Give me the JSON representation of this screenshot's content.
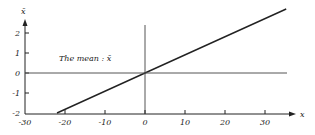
{
  "chart_data": {
    "type": "line",
    "title": "",
    "xlabel": "x",
    "ylabel": "x̄",
    "xlim": [
      -30,
      35
    ],
    "ylim": [
      -2,
      2.5
    ],
    "x_ticks": [
      -30,
      -20,
      -10,
      0,
      10,
      20,
      30
    ],
    "x_tick_labels": [
      "-30",
      "-20",
      "-10",
      "0",
      "10",
      "20",
      "30"
    ],
    "y_ticks": [
      -2,
      -1,
      0,
      1,
      2
    ],
    "y_tick_labels": [
      "-2",
      "-1",
      "0",
      "1",
      "2"
    ],
    "grid": false,
    "annotation": "The mean : x̄",
    "series": [
      {
        "name": "x̄ vs x",
        "x": [
          -22,
          0,
          35.3
        ],
        "y": [
          -2,
          0,
          3.2
        ],
        "color": "#222222"
      },
      {
        "name": "reference y=0",
        "x": [
          -30,
          35.5
        ],
        "y": [
          0,
          0
        ],
        "color": "#555555"
      }
    ],
    "reference_lines": {
      "vertical_at_x": 0,
      "horizontal_at_y": 0
    }
  },
  "colors": {
    "ink": "#222222",
    "background": "#ffffff"
  }
}
